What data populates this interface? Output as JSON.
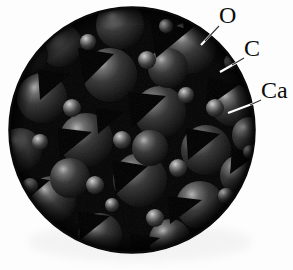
{
  "figure": {
    "kind": "space-filling-atomic-model",
    "shape": "circle",
    "background_color": "#fdfdfd",
    "disc": {
      "center_x": 132,
      "center_y": 130,
      "radius": 123,
      "rim_color": "#000000",
      "void_color": "#000000",
      "sphere_base_color": "#232323",
      "sphere_highlight_color": "#9a9a9a"
    }
  },
  "labels": [
    {
      "id": "o",
      "text": "O",
      "name": "label-oxygen",
      "x": 219,
      "y": 3,
      "leader": {
        "x1": 218,
        "y1": 27,
        "x2": 201,
        "y2": 45
      }
    },
    {
      "id": "c",
      "text": "C",
      "name": "label-carbon",
      "x": 244,
      "y": 36,
      "leader": {
        "x1": 243,
        "y1": 59,
        "x2": 220,
        "y2": 72
      }
    },
    {
      "id": "ca",
      "text": "Ca",
      "name": "label-calcium",
      "x": 261,
      "y": 78,
      "leader": {
        "x1": 260,
        "y1": 101,
        "x2": 228,
        "y2": 113
      }
    }
  ],
  "atoms": {
    "large_spheres": [
      {
        "cx": 190,
        "cy": 48,
        "r": 26
      },
      {
        "cx": 110,
        "cy": 75,
        "r": 27
      },
      {
        "cx": 42,
        "cy": 98,
        "r": 25
      },
      {
        "cx": 160,
        "cy": 112,
        "r": 26
      },
      {
        "cx": 86,
        "cy": 140,
        "r": 27
      },
      {
        "cx": 206,
        "cy": 150,
        "r": 25
      },
      {
        "cx": 140,
        "cy": 180,
        "r": 27
      },
      {
        "cx": 52,
        "cy": 200,
        "r": 24
      },
      {
        "cx": 200,
        "cy": 205,
        "r": 24
      },
      {
        "cx": 120,
        "cy": 25,
        "r": 24
      },
      {
        "cx": 60,
        "cy": 45,
        "r": 22
      },
      {
        "cx": 232,
        "cy": 105,
        "r": 21
      },
      {
        "cx": 20,
        "cy": 150,
        "r": 22
      },
      {
        "cx": 240,
        "cy": 175,
        "r": 20
      },
      {
        "cx": 100,
        "cy": 235,
        "r": 22
      },
      {
        "cx": 170,
        "cy": 240,
        "r": 21
      },
      {
        "cx": 28,
        "cy": 55,
        "r": 20
      },
      {
        "cx": 250,
        "cy": 135,
        "r": 18
      }
    ],
    "small_spheres": [
      {
        "cx": 215,
        "cy": 108,
        "r": 9
      },
      {
        "cx": 147,
        "cy": 60,
        "r": 9
      },
      {
        "cx": 72,
        "cy": 108,
        "r": 9
      },
      {
        "cx": 122,
        "cy": 140,
        "r": 9
      },
      {
        "cx": 186,
        "cy": 95,
        "r": 8
      },
      {
        "cx": 178,
        "cy": 168,
        "r": 9
      },
      {
        "cx": 95,
        "cy": 185,
        "r": 9
      },
      {
        "cx": 232,
        "cy": 62,
        "r": 8
      },
      {
        "cx": 40,
        "cy": 142,
        "r": 8
      },
      {
        "cx": 155,
        "cy": 218,
        "r": 9
      },
      {
        "cx": 60,
        "cy": 240,
        "r": 8
      },
      {
        "cx": 226,
        "cy": 196,
        "r": 8
      },
      {
        "cx": 88,
        "cy": 42,
        "r": 8
      },
      {
        "cx": 30,
        "cy": 186,
        "r": 8
      },
      {
        "cx": 205,
        "cy": 246,
        "r": 8
      },
      {
        "cx": 250,
        "cy": 152,
        "r": 7
      }
    ],
    "voids": [
      {
        "x": 150,
        "y": 18,
        "s": 40,
        "rot": 0
      },
      {
        "x": 78,
        "y": 48,
        "s": 36,
        "rot": 12
      },
      {
        "x": 208,
        "y": 78,
        "s": 34,
        "rot": -8
      },
      {
        "x": 128,
        "y": 92,
        "s": 40,
        "rot": 5
      },
      {
        "x": 38,
        "y": 70,
        "s": 32,
        "rot": -15
      },
      {
        "x": 186,
        "y": 128,
        "s": 38,
        "rot": 18
      },
      {
        "x": 58,
        "y": 128,
        "s": 36,
        "rot": -5
      },
      {
        "x": 112,
        "y": 160,
        "s": 38,
        "rot": 10
      },
      {
        "x": 232,
        "y": 148,
        "s": 30,
        "rot": 0
      },
      {
        "x": 22,
        "y": 176,
        "s": 30,
        "rot": 20
      },
      {
        "x": 168,
        "y": 196,
        "s": 36,
        "rot": -12
      },
      {
        "x": 78,
        "y": 212,
        "s": 34,
        "rot": 8
      },
      {
        "x": 130,
        "y": 234,
        "s": 30,
        "rot": -6
      },
      {
        "x": 212,
        "y": 218,
        "s": 28,
        "rot": 14
      }
    ]
  }
}
